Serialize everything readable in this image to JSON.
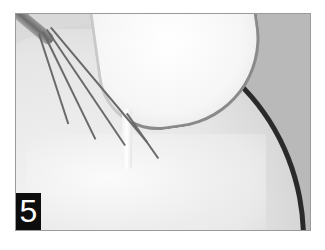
{
  "image": {
    "description": "Milky liquid being poured from a glass measuring jug into a bowl while a wire whisk stirs",
    "step_badge": "5",
    "colors": {
      "badge_background": "#0d0d0d",
      "badge_text": "#ffffff",
      "bowl_rim": "#2a2a2a",
      "page_background": "#ffffff"
    }
  }
}
